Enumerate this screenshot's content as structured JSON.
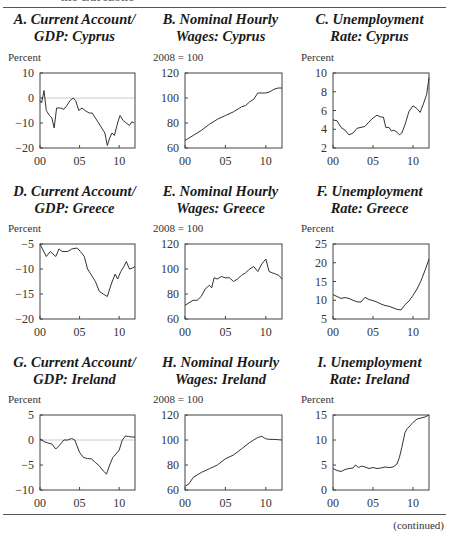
{
  "header_fragment": "the Eurozone",
  "footer_note": "(continued)",
  "chart_data": [
    {
      "id": "A",
      "type": "line",
      "title": "A. Current Account/ GDP: Cyprus",
      "title_lines": [
        "A. Current Account/",
        "GDP: Cyprus"
      ],
      "ylabel": "Percent",
      "ylim": [
        -20,
        10
      ],
      "yticks": [
        -20,
        -10,
        0,
        10
      ],
      "ytick_labels": [
        "−20",
        "−10",
        "0",
        "10"
      ],
      "xlim": [
        2000,
        2012
      ],
      "xticks": [
        2000,
        2005,
        2010
      ],
      "xtick_labels": [
        "00",
        "05",
        "10"
      ],
      "zero_line": true,
      "x": [
        2000,
        2000.2,
        2000.5,
        2000.8,
        2001.2,
        2001.5,
        2001.8,
        2002.1,
        2002.6,
        2003.0,
        2003.4,
        2003.8,
        2004.2,
        2004.5,
        2004.9,
        2005.3,
        2005.7,
        2006.2,
        2006.6,
        2007.0,
        2007.4,
        2007.8,
        2008.2,
        2008.5,
        2008.8,
        2009.1,
        2009.4,
        2009.8,
        2010.1,
        2010.5,
        2010.9,
        2011.3,
        2011.6,
        2011.9
      ],
      "values": [
        -1,
        -2,
        3,
        -5,
        -7,
        -8,
        -12,
        -4,
        -4,
        -4.5,
        -3,
        -1,
        0,
        -1,
        -5,
        -4,
        -5,
        -6,
        -6,
        -8,
        -10,
        -12,
        -14,
        -19,
        -16,
        -14,
        -15,
        -10,
        -7,
        -9,
        -10,
        -11,
        -9.5,
        -10
      ]
    },
    {
      "id": "B",
      "type": "line",
      "title": "B. Nominal Hourly Wages: Cyprus",
      "title_lines": [
        "B. Nominal Hourly",
        "Wages: Cyprus"
      ],
      "ylabel": "2008 = 100",
      "ylim": [
        60,
        120
      ],
      "yticks": [
        60,
        80,
        100,
        120
      ],
      "ytick_labels": [
        "60",
        "80",
        "100",
        "120"
      ],
      "xlim": [
        2000,
        2012
      ],
      "xticks": [
        2000,
        2005,
        2010
      ],
      "xtick_labels": [
        "00",
        "05",
        "10"
      ],
      "x": [
        2000,
        2001,
        2002,
        2003,
        2004,
        2005,
        2006,
        2007,
        2007.5,
        2008,
        2008.5,
        2009,
        2010,
        2010.5,
        2011,
        2011.5,
        2012
      ],
      "values": [
        66,
        70,
        74,
        79,
        83,
        86,
        89,
        93,
        94,
        97,
        99,
        104,
        104,
        105,
        107,
        108,
        108
      ]
    },
    {
      "id": "C",
      "type": "line",
      "title": "C. Unemployment Rate: Cyprus",
      "title_lines": [
        "C. Unemployment",
        "Rate: Cyprus"
      ],
      "ylabel": "Percent",
      "ylim": [
        2,
        10
      ],
      "yticks": [
        2,
        4,
        6,
        8,
        10
      ],
      "ytick_labels": [
        "2",
        "4",
        "6",
        "8",
        "10"
      ],
      "xlim": [
        2000,
        2012
      ],
      "xticks": [
        2000,
        2005,
        2010
      ],
      "xtick_labels": [
        "00",
        "05",
        "10"
      ],
      "x": [
        2000,
        2000.5,
        2001,
        2001.5,
        2002,
        2002.5,
        2003,
        2003.5,
        2004,
        2004.5,
        2005,
        2005.5,
        2006,
        2006.3,
        2006.6,
        2007,
        2007.3,
        2007.6,
        2008,
        2008.3,
        2008.6,
        2009,
        2009.5,
        2010,
        2010.5,
        2010.9,
        2011.3,
        2011.7,
        2012
      ],
      "values": [
        5,
        4.9,
        4.2,
        3.9,
        3.4,
        3.6,
        4.1,
        4.2,
        4.3,
        4.8,
        5.2,
        5.5,
        5.3,
        5.3,
        4.2,
        4.2,
        3.8,
        3.9,
        3.7,
        3.4,
        3.6,
        4.5,
        5.9,
        6.5,
        6.2,
        5.8,
        6.7,
        7.7,
        9.5
      ]
    },
    {
      "id": "D",
      "type": "line",
      "title": "D. Current Account/ GDP: Greece",
      "title_lines": [
        "D. Current Account/",
        "GDP: Greece"
      ],
      "ylabel": "Percent",
      "ylim": [
        -20,
        -5
      ],
      "yticks": [
        -20,
        -15,
        -10,
        -5
      ],
      "ytick_labels": [
        "−20",
        "−15",
        "−10",
        "−5"
      ],
      "xlim": [
        2000,
        2012
      ],
      "xticks": [
        2000,
        2005,
        2010
      ],
      "xtick_labels": [
        "00",
        "05",
        "10"
      ],
      "x": [
        2000,
        2000.8,
        2001.3,
        2002,
        2002.4,
        2002.8,
        2003.5,
        2004,
        2004.7,
        2005.1,
        2005.6,
        2006,
        2006.4,
        2007,
        2007.5,
        2008,
        2008.5,
        2009,
        2009.5,
        2009.8,
        2010.2,
        2010.6,
        2010.9,
        2011.3,
        2011.7,
        2012
      ],
      "values": [
        -5,
        -7.5,
        -6.5,
        -7.5,
        -6,
        -6.5,
        -6.5,
        -6,
        -5.8,
        -6.5,
        -7.5,
        -10,
        -11,
        -12.5,
        -14.5,
        -15,
        -15.5,
        -13,
        -11,
        -12,
        -10.5,
        -9.5,
        -8.5,
        -10,
        -9.8,
        -9.5
      ]
    },
    {
      "id": "E",
      "type": "line",
      "title": "E. Nominal Hourly Wages: Greece",
      "title_lines": [
        "E. Nominal Hourly",
        "Wages: Greece"
      ],
      "ylabel": "2008 = 100",
      "ylim": [
        60,
        120
      ],
      "yticks": [
        60,
        80,
        100,
        120
      ],
      "ytick_labels": [
        "60",
        "80",
        "100",
        "120"
      ],
      "xlim": [
        2000,
        2012
      ],
      "xticks": [
        2000,
        2005,
        2010
      ],
      "xtick_labels": [
        "00",
        "05",
        "10"
      ],
      "x": [
        2000,
        2000.5,
        2001,
        2001.5,
        2002,
        2002.5,
        2003,
        2003.3,
        2003.6,
        2004,
        2004.5,
        2005,
        2005.5,
        2006,
        2006.5,
        2007,
        2007.5,
        2008,
        2008.5,
        2009,
        2009.5,
        2010,
        2010.4,
        2010.8,
        2011.2,
        2011.6,
        2012
      ],
      "values": [
        71,
        73,
        75,
        75,
        78,
        84,
        87,
        85,
        93,
        92,
        94,
        93,
        93,
        90,
        92,
        95,
        97,
        100,
        102,
        98,
        104,
        108,
        98,
        97,
        96,
        95,
        92
      ]
    },
    {
      "id": "F",
      "type": "line",
      "title": "F. Unemployment Rate: Greece",
      "title_lines": [
        "F. Unemployment",
        "Rate: Greece"
      ],
      "ylabel": "Percent",
      "ylim": [
        5,
        25
      ],
      "yticks": [
        5,
        10,
        15,
        20,
        25
      ],
      "ytick_labels": [
        "5",
        "10",
        "15",
        "20",
        "25"
      ],
      "xlim": [
        2000,
        2012
      ],
      "xticks": [
        2000,
        2005,
        2010
      ],
      "xtick_labels": [
        "00",
        "05",
        "10"
      ],
      "x": [
        2000,
        2000.5,
        2001,
        2001.5,
        2002,
        2002.5,
        2003,
        2003.5,
        2004,
        2004.5,
        2005,
        2005.5,
        2006,
        2006.5,
        2007,
        2007.5,
        2008,
        2008.5,
        2009,
        2009.5,
        2010,
        2010.5,
        2011,
        2011.5,
        2012
      ],
      "values": [
        11.5,
        11,
        10.5,
        10.7,
        10.5,
        10,
        9.6,
        9.5,
        10.8,
        10.2,
        9.9,
        9.5,
        9,
        8.6,
        8.4,
        8,
        7.6,
        7.4,
        8.8,
        9.8,
        11.3,
        13,
        15.2,
        18,
        21
      ]
    },
    {
      "id": "G",
      "type": "line",
      "title": "G. Current Account/ GDP: Ireland",
      "title_lines": [
        "G. Current Account/",
        "GDP: Ireland"
      ],
      "ylabel": "Percent",
      "ylim": [
        -10,
        5
      ],
      "yticks": [
        -10,
        -5,
        0,
        5
      ],
      "ytick_labels": [
        "−10",
        "−5",
        "0",
        "5"
      ],
      "xlim": [
        2000,
        2012
      ],
      "xticks": [
        2000,
        2005,
        2010
      ],
      "xtick_labels": [
        "00",
        "05",
        "10"
      ],
      "zero_line": true,
      "x": [
        2000,
        2000.5,
        2001,
        2001.5,
        2002,
        2002.5,
        2003,
        2003.5,
        2004,
        2004.4,
        2005,
        2005.5,
        2006,
        2006.5,
        2007,
        2007.5,
        2008,
        2008.4,
        2008.8,
        2009.2,
        2009.6,
        2010,
        2010.4,
        2010.8,
        2011.2,
        2011.6,
        2012
      ],
      "values": [
        0.2,
        -0.3,
        -0.6,
        -0.8,
        -1.8,
        -1,
        0,
        0,
        0.3,
        0,
        -2.5,
        -3.5,
        -3.7,
        -3.8,
        -4.5,
        -5.2,
        -6.2,
        -6.8,
        -5,
        -3.5,
        -2.8,
        -2,
        0,
        0.8,
        0.7,
        0.6,
        0.6
      ]
    },
    {
      "id": "H",
      "type": "line",
      "title": "H. Nominal Hourly Wages: Ireland",
      "title_lines": [
        "H. Nominal Hourly",
        "Wages: Ireland"
      ],
      "ylabel": "2008 = 100",
      "ylim": [
        60,
        120
      ],
      "yticks": [
        60,
        80,
        100,
        120
      ],
      "ytick_labels": [
        "60",
        "80",
        "100",
        "120"
      ],
      "xlim": [
        2000,
        2012
      ],
      "xticks": [
        2000,
        2005,
        2010
      ],
      "xtick_labels": [
        "00",
        "05",
        "10"
      ],
      "x": [
        2000,
        2000.5,
        2001,
        2002,
        2003,
        2004,
        2005,
        2006,
        2007,
        2008,
        2008.5,
        2009,
        2009.5,
        2010,
        2010.5,
        2011,
        2012
      ],
      "values": [
        63,
        65,
        70,
        74,
        77,
        80,
        85,
        88,
        93,
        98,
        100,
        102,
        103,
        101,
        100.5,
        100.5,
        100
      ]
    },
    {
      "id": "I",
      "type": "line",
      "title": "I. Unemployment Rate: Ireland",
      "title_lines": [
        "I. Unemployment",
        "Rate: Ireland"
      ],
      "ylabel": "Percent",
      "ylim": [
        0,
        15
      ],
      "yticks": [
        0,
        5,
        10,
        15
      ],
      "ytick_labels": [
        "0",
        "5",
        "10",
        "15"
      ],
      "xlim": [
        2000,
        2012
      ],
      "xticks": [
        2000,
        2005,
        2010
      ],
      "xtick_labels": [
        "00",
        "05",
        "10"
      ],
      "x": [
        2000,
        2000.5,
        2001,
        2001.5,
        2002,
        2002.5,
        2002.8,
        2003.2,
        2003.6,
        2004,
        2004.5,
        2005,
        2005.5,
        2006,
        2006.5,
        2007,
        2007.5,
        2008,
        2008.3,
        2008.6,
        2009,
        2009.3,
        2009.6,
        2010,
        2010.5,
        2011,
        2011.5,
        2012
      ],
      "values": [
        4.3,
        3.9,
        3.7,
        4.1,
        4.3,
        4.4,
        5,
        4.5,
        4.8,
        4.6,
        4.3,
        4.5,
        4.3,
        4.4,
        4.6,
        4.5,
        4.6,
        5.2,
        6.5,
        8.5,
        11.5,
        12.3,
        12.8,
        13.5,
        14.2,
        14.4,
        14.6,
        15
      ]
    }
  ]
}
